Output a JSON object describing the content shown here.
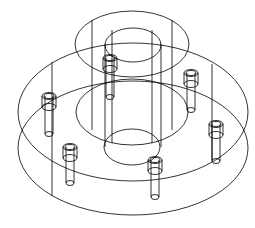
{
  "drawing": {
    "type": "isometric wireframe",
    "subject": "flanged hub with six bolts",
    "stroke_color": "#000000",
    "background": "#ffffff",
    "hub": {
      "outer_top": {
        "cx": 132,
        "cy": 44,
        "rx": 57,
        "ry": 33
      },
      "inner_top": {
        "cx": 133,
        "cy": 45,
        "rx": 28,
        "ry": 17
      },
      "outer_bottom": {
        "cx": 132,
        "cy": 112,
        "rx": 56,
        "ry": 33
      },
      "inner_bottom": {
        "cx": 132,
        "cy": 147,
        "rx": 28,
        "ry": 18
      }
    },
    "flange": {
      "top": {
        "cx": 133,
        "cy": 112,
        "rx": 115,
        "ry": 69
      },
      "bottom": {
        "cx": 133,
        "cy": 148,
        "rx": 115,
        "ry": 67
      }
    },
    "bolt_count": 6,
    "bolts": [
      {
        "x": 110,
        "top": 58,
        "bottom": 97
      },
      {
        "x": 191,
        "top": 73,
        "bottom": 110
      },
      {
        "x": 49,
        "top": 96,
        "bottom": 134
      },
      {
        "x": 216,
        "top": 124,
        "bottom": 161
      },
      {
        "x": 70,
        "top": 147,
        "bottom": 183
      },
      {
        "x": 155,
        "top": 160,
        "bottom": 197
      }
    ]
  }
}
